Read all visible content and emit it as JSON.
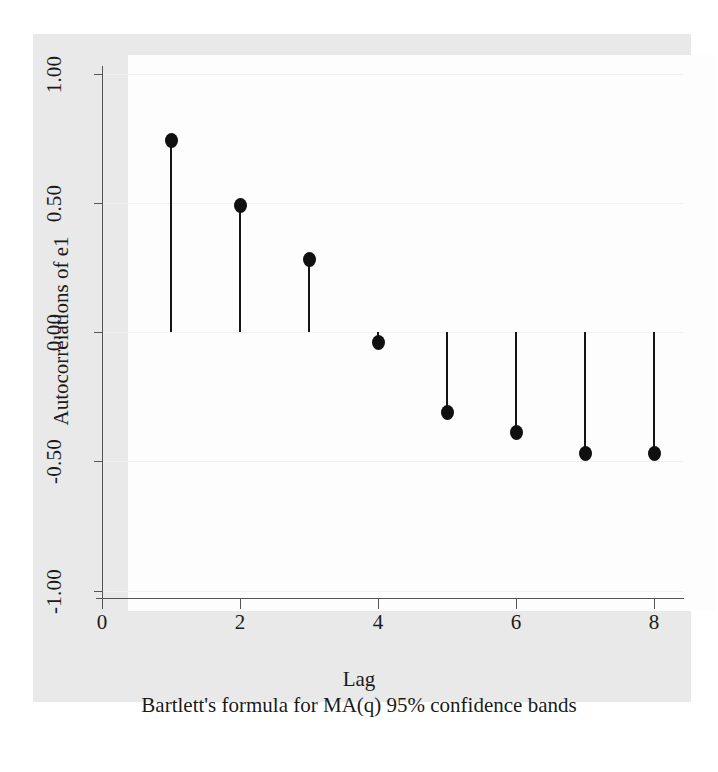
{
  "chart_data": {
    "type": "scatter",
    "subtype": "stem-acf",
    "title": "",
    "xlabel": "Lag",
    "ylabel": "Autocorrelations of e1",
    "note": "Bartlett's formula for MA(q) 95% confidence bands",
    "x": [
      1,
      2,
      3,
      4,
      5,
      6,
      7,
      8
    ],
    "values": [
      0.74,
      0.49,
      0.28,
      -0.04,
      -0.31,
      -0.39,
      -0.47,
      -0.47
    ],
    "categories": [
      "1",
      "2",
      "3",
      "4",
      "5",
      "6",
      "7",
      "8"
    ],
    "series": [
      {
        "name": "Autocorrelations of e1",
        "values": [
          0.74,
          0.49,
          0.28,
          -0.04,
          -0.31,
          -0.39,
          -0.47,
          -0.47
        ]
      }
    ],
    "xlim": [
      0,
      8.35
    ],
    "ylim": [
      -1.0,
      1.0
    ],
    "xticks": [
      0,
      2,
      4,
      6,
      8
    ],
    "xticklabels": [
      "0",
      "2",
      "4",
      "6",
      "8"
    ],
    "yticks": [
      1.0,
      0.5,
      0.0,
      -0.5,
      -1.0
    ],
    "yticklabels": [
      "1.00",
      "0.50",
      "0.00",
      "-0.50",
      "-1.00"
    ],
    "grid": true,
    "legend": false,
    "baseline": 0.0,
    "marker_color": "#101010",
    "stem_color": "#151515",
    "plot_background": "#fdfdfd",
    "figure_background": "#e9e9e9",
    "gridline_color": "#f0f0f0",
    "axis_color": "#545454"
  },
  "axis": {
    "y_title": "Autocorrelations of e1",
    "x_title": "Lag",
    "caption": "Bartlett's formula for MA(q) 95% confidence bands",
    "yticklabels": [
      "1.00",
      "0.50",
      "0.00",
      "-0.50",
      "-1.00"
    ],
    "xticklabels": [
      "0",
      "2",
      "4",
      "6",
      "8"
    ]
  },
  "points": [
    {
      "lag": "1",
      "value": "0.74"
    },
    {
      "lag": "2",
      "value": "0.49"
    },
    {
      "lag": "3",
      "value": "0.28"
    },
    {
      "lag": "4",
      "value": "-0.04"
    },
    {
      "lag": "5",
      "value": "-0.31"
    },
    {
      "lag": "6",
      "value": "-0.39"
    },
    {
      "lag": "7",
      "value": "-0.47"
    },
    {
      "lag": "8",
      "value": "-0.47"
    }
  ]
}
